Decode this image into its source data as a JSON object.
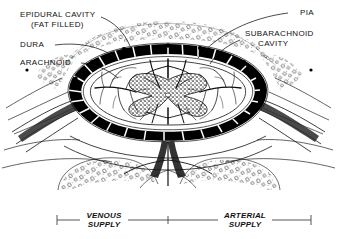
{
  "figure": {
    "ink_color": "#000000",
    "background_color": "#ffffff",
    "labels": {
      "epidural_cavity_line1": "EPIDURAL CAVITY",
      "epidural_cavity_line2": "(FAT FILLED)",
      "dura": "DURA",
      "arachnoid": "ARACHNOID",
      "pia": "PIA",
      "subarachnoid_line1": "SUBARACHNOID",
      "subarachnoid_line2": "CAVITY"
    },
    "scale_bar": {
      "venous_line1": "VENOUS",
      "venous_line2": "SUPPLY",
      "arterial_line1": "ARTERIAL",
      "arterial_line2": "SUPPLY",
      "left_tick_x": 57,
      "mid_tick_x": 168,
      "right_tick_x": 311,
      "baseline_y": 220
    }
  }
}
